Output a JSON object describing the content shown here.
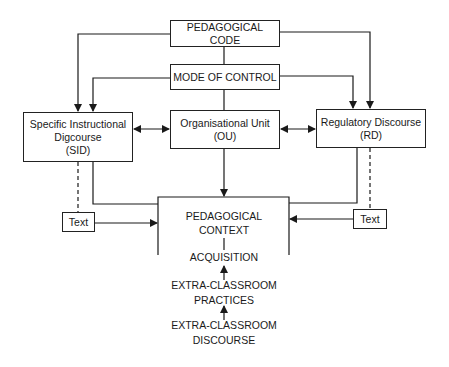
{
  "diagram": {
    "nodes": {
      "pedagogical_code": {
        "label": "PEDAGOGICAL CODE"
      },
      "mode_of_control": {
        "label": "MODE OF CONTROL"
      },
      "sid": {
        "line1": "Specific Instructional",
        "line2": "Digcourse",
        "line3": "(SID)"
      },
      "ou": {
        "line1": "Organisational Unit",
        "line2": "(OU)"
      },
      "rd": {
        "line1": "Regulatory Discourse",
        "line2": "(RD)"
      },
      "text_left": {
        "label": "Text"
      },
      "text_right": {
        "label": "Text"
      },
      "pedagogical_context": {
        "line1": "PEDAGOGICAL",
        "line2": "CONTEXT"
      },
      "acquisition": {
        "label": "ACQUISITION"
      },
      "extra_practices": {
        "line1": "EXTRA-CLASSROOM",
        "line2": "PRACTICES"
      },
      "extra_discourse": {
        "line1": "EXTRA-CLASSROOM",
        "line2": "DISCOURSE"
      }
    },
    "edges": [
      {
        "from": "PEDAGOGICAL CODE",
        "to": "Specific Instructional Digcourse (SID)",
        "style": "arrow"
      },
      {
        "from": "PEDAGOGICAL CODE",
        "to": "Regulatory Discourse (RD)",
        "style": "arrow"
      },
      {
        "from": "PEDAGOGICAL CODE",
        "to": "MODE OF CONTROL",
        "style": "line"
      },
      {
        "from": "MODE OF CONTROL",
        "to": "Specific Instructional Digcourse (SID)",
        "style": "arrow"
      },
      {
        "from": "MODE OF CONTROL",
        "to": "Regulatory Discourse (RD)",
        "style": "arrow"
      },
      {
        "from": "MODE OF CONTROL",
        "to": "Organisational Unit (OU)",
        "style": "line"
      },
      {
        "from": "Specific Instructional Digcourse (SID)",
        "to": "Organisational Unit (OU)",
        "style": "double-arrow"
      },
      {
        "from": "Organisational Unit (OU)",
        "to": "Regulatory Discourse (RD)",
        "style": "double-arrow"
      },
      {
        "from": "Organisational Unit (OU)",
        "to": "PEDAGOGICAL CONTEXT",
        "style": "arrow"
      },
      {
        "from": "Specific Instructional Digcourse (SID)",
        "to": "PEDAGOGICAL CONTEXT",
        "style": "line"
      },
      {
        "from": "Regulatory Discourse (RD)",
        "to": "PEDAGOGICAL CONTEXT",
        "style": "line"
      },
      {
        "from": "Specific Instructional Digcourse (SID)",
        "to": "Text (left)",
        "style": "dashed"
      },
      {
        "from": "Regulatory Discourse (RD)",
        "to": "Text (right)",
        "style": "dashed"
      },
      {
        "from": "Text (left)",
        "to": "PEDAGOGICAL CONTEXT",
        "style": "arrow"
      },
      {
        "from": "Text (right)",
        "to": "PEDAGOGICAL CONTEXT",
        "style": "arrow"
      },
      {
        "from": "PEDAGOGICAL CONTEXT",
        "to": "ACQUISITION",
        "style": "line"
      },
      {
        "from": "EXTRA-CLASSROOM PRACTICES",
        "to": "ACQUISITION",
        "style": "arrow"
      },
      {
        "from": "EXTRA-CLASSROOM DISCOURSE",
        "to": "EXTRA-CLASSROOM PRACTICES",
        "style": "arrow"
      }
    ]
  }
}
